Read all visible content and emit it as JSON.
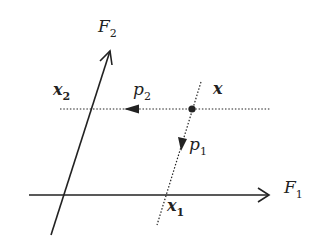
{
  "diagram": {
    "type": "projection-on-oblique-axes",
    "axes": {
      "f1": {
        "name": "F",
        "sub": "1"
      },
      "f2": {
        "name": "F",
        "sub": "2"
      }
    },
    "point": {
      "name": "x"
    },
    "projections": {
      "x1": {
        "name": "x",
        "sub": "1"
      },
      "x2": {
        "name": "x",
        "sub": "2"
      }
    },
    "directions": {
      "p1": {
        "name": "p",
        "sub": "1"
      },
      "p2": {
        "name": "p",
        "sub": "2"
      }
    },
    "colors": {
      "line": "#222222",
      "background": "#ffffff"
    }
  }
}
